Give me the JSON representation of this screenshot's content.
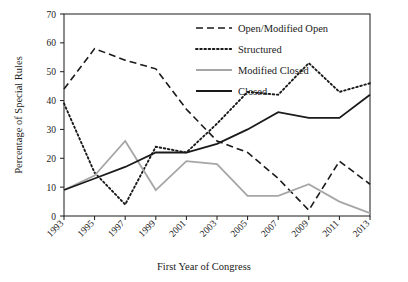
{
  "chart_data": {
    "type": "line",
    "title": "",
    "xlabel": "First Year of Congress",
    "ylabel": "Percentage of Special Rules",
    "xlim": [
      1993,
      2013
    ],
    "ylim": [
      0,
      70
    ],
    "yticks": [
      0,
      10,
      20,
      30,
      40,
      50,
      60,
      70
    ],
    "xticks": [
      1993,
      1995,
      1997,
      1999,
      2001,
      2003,
      2005,
      2007,
      2009,
      2011,
      2013
    ],
    "categories": [
      "1993",
      "1995",
      "1997",
      "1999",
      "2001",
      "2003",
      "2005",
      "2007",
      "2009",
      "2011",
      "2013"
    ],
    "grid": false,
    "legend_position": "top-right",
    "series": [
      {
        "name": "Open/Modified Open",
        "style": "dashed",
        "color": "#1a1a1a",
        "values": [
          44,
          58,
          54,
          51,
          37,
          26,
          22,
          13,
          2,
          19,
          11
        ]
      },
      {
        "name": "Structured",
        "style": "dotted",
        "color": "#1a1a1a",
        "values": [
          39,
          15,
          4,
          24,
          22,
          32,
          43,
          42,
          53,
          43,
          46
        ]
      },
      {
        "name": "Modified Closed",
        "style": "solid",
        "color": "#a6a6a6",
        "values": [
          9,
          14,
          26,
          9,
          19,
          18,
          7,
          7,
          11,
          5,
          1
        ]
      },
      {
        "name": "Closed",
        "style": "solid",
        "color": "#1a1a1a",
        "values": [
          9,
          13,
          17,
          22,
          22,
          25,
          30,
          36,
          34,
          34,
          42
        ]
      }
    ]
  },
  "legend": {
    "items": [
      {
        "label": "Open/Modified Open"
      },
      {
        "label": "Structured"
      },
      {
        "label": "Modified Closed"
      },
      {
        "label": "Closed"
      }
    ]
  },
  "axes": {
    "y_title": "Percentage of Special Rules",
    "x_title": "First Year of Congress"
  }
}
